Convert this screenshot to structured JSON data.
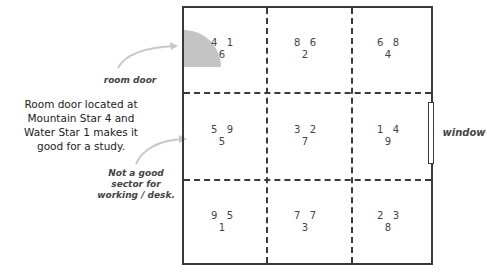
{
  "diagram": {
    "type": "floor-plan-grid",
    "rows": 3,
    "cols": 3,
    "cells": [
      {
        "position": "top-left",
        "left": "4",
        "right": "1",
        "bottom": "6"
      },
      {
        "position": "top-center",
        "left": "8",
        "right": "6",
        "bottom": "2"
      },
      {
        "position": "top-right",
        "left": "6",
        "right": "8",
        "bottom": "4"
      },
      {
        "position": "middle-left",
        "left": "5",
        "right": "9",
        "bottom": "5"
      },
      {
        "position": "middle-center",
        "left": "3",
        "right": "2",
        "bottom": "7"
      },
      {
        "position": "middle-right",
        "left": "1",
        "right": "4",
        "bottom": "9"
      },
      {
        "position": "bottom-left",
        "left": "9",
        "right": "5",
        "bottom": "1"
      },
      {
        "position": "bottom-center",
        "left": "7",
        "right": "7",
        "bottom": "3"
      },
      {
        "position": "bottom-right",
        "left": "2",
        "right": "3",
        "bottom": "8"
      }
    ],
    "colors": {
      "line": "#3a3a3a",
      "door_fill": "#c4c4c4",
      "arrow": "#c8c8c8",
      "text": "#333333"
    }
  },
  "labels": {
    "room_door": "room door",
    "window": "window",
    "study_note_lines": [
      "Room door located at",
      "Mountain Star 4 and",
      "Water Star 1 makes it",
      "good for a study."
    ],
    "desk_note_lines": [
      "Not a good",
      "sector for",
      "working / desk."
    ]
  }
}
